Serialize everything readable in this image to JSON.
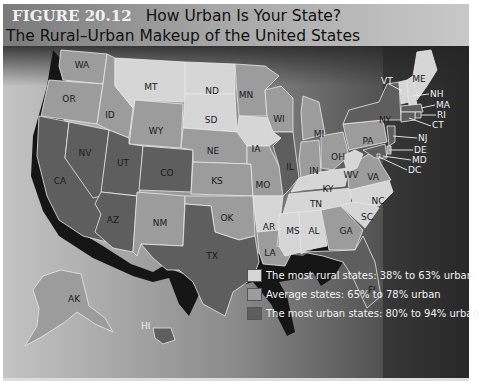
{
  "figure": {
    "number": "FIGURE 20.12",
    "title": "How Urban Is Your State?",
    "subtitle": "The Rural–Urban Makeup of the United States"
  },
  "colors": {
    "rural": "#d6d6d6",
    "average": "#9c9c9c",
    "urban": "#5e5e5e",
    "water": "#3a3a3a",
    "land_bg": "#a8a8a8",
    "coast_shadow": "#151515"
  },
  "legend": {
    "items": [
      {
        "key": "rural",
        "label": "The most rural states: 38% to 63% urban"
      },
      {
        "key": "average",
        "label": "Average states: 65% to 78% urban"
      },
      {
        "key": "urban",
        "label": "The most urban states: 80% to 94% urban"
      }
    ]
  },
  "states": {
    "WA": "average",
    "OR": "average",
    "CA": "urban",
    "NV": "urban",
    "ID": "average",
    "MT": "rural",
    "WY": "average",
    "UT": "urban",
    "CO": "urban",
    "AZ": "urban",
    "NM": "average",
    "ND": "rural",
    "SD": "rural",
    "NE": "average",
    "KS": "average",
    "OK": "average",
    "TX": "urban",
    "MN": "average",
    "IA": "rural",
    "MO": "average",
    "AR": "rural",
    "LA": "average",
    "WI": "average",
    "IL": "urban",
    "MI": "average",
    "IN": "average",
    "OH": "average",
    "KY": "rural",
    "TN": "rural",
    "MS": "rural",
    "AL": "rural",
    "GA": "average",
    "FL": "urban",
    "SC": "rural",
    "NC": "rural",
    "VA": "average",
    "WV": "rural",
    "PA": "average",
    "NY": "urban",
    "VT": "rural",
    "NH": "rural",
    "ME": "rural",
    "MA": "urban",
    "RI": "urban",
    "CT": "urban",
    "NJ": "urban",
    "DE": "average",
    "MD": "urban",
    "DC": "urban",
    "AK": "average",
    "HI": "urban"
  },
  "labels": {
    "WA": "WA",
    "OR": "OR",
    "CA": "CA",
    "NV": "NV",
    "ID": "ID",
    "MT": "MT",
    "WY": "WY",
    "UT": "UT",
    "CO": "CO",
    "AZ": "AZ",
    "NM": "NM",
    "ND": "ND",
    "SD": "SD",
    "NE": "NE",
    "KS": "KS",
    "OK": "OK",
    "TX": "TX",
    "MN": "MN",
    "IA": "IA",
    "MO": "MO",
    "AR": "AR",
    "LA": "LA",
    "WI": "WI",
    "IL": "IL",
    "MI": "MI",
    "IN": "IN",
    "OH": "OH",
    "KY": "KY",
    "TN": "TN",
    "MS": "MS",
    "AL": "AL",
    "GA": "GA",
    "FL": "FL",
    "SC": "SC",
    "NC": "NC",
    "VA": "VA",
    "WV": "WV",
    "PA": "PA",
    "NY": "NY",
    "VT": "VT",
    "NH": "NH",
    "ME": "ME",
    "MA": "MA",
    "RI": "RI",
    "CT": "CT",
    "NJ": "NJ",
    "DE": "DE",
    "MD": "MD",
    "DC": "DC",
    "AK": "AK",
    "HI": "HI"
  }
}
